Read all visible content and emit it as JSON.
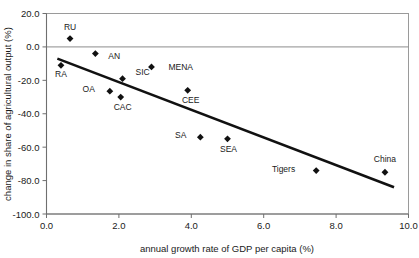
{
  "chart_data": {
    "type": "scatter",
    "title": "",
    "xlabel": "annual growth rate of GDP per capita (%)",
    "ylabel": "change in share of agricultural output (%)",
    "xlim": [
      0.0,
      10.0
    ],
    "ylim": [
      -100.0,
      20.0
    ],
    "xticks": [
      "0.0",
      "2.0",
      "4.0",
      "6.0",
      "8.0",
      "10.0"
    ],
    "xtick_values": [
      0.0,
      2.0,
      4.0,
      6.0,
      8.0,
      10.0
    ],
    "yticks": [
      "20.0",
      "0.0",
      "-20.0",
      "-40.0",
      "-60.0",
      "-80.0",
      "-100.0"
    ],
    "ytick_values": [
      20.0,
      0.0,
      -20.0,
      -40.0,
      -60.0,
      -80.0,
      -100.0
    ],
    "grid": false,
    "legend": "none",
    "zero_reference_line": 0.0,
    "points": [
      {
        "label": "RU",
        "x": 0.65,
        "y": 5.0,
        "label_dx": 0,
        "label_dy": -9
      },
      {
        "label": "RA",
        "x": 0.4,
        "y": -11.0,
        "label_dx": 0,
        "label_dy": 12
      },
      {
        "label": "AN",
        "x": 1.35,
        "y": -4.0,
        "label_dx": 13,
        "label_dy": 5
      },
      {
        "label": "OA",
        "x": 1.75,
        "y": -26.5,
        "label_dx": -15,
        "label_dy": 1
      },
      {
        "label": "CAC",
        "x": 2.05,
        "y": -30.0,
        "label_dx": 2,
        "label_dy": 13
      },
      {
        "label": "SIC",
        "x": 2.1,
        "y": -19.0,
        "label_dx": 13,
        "label_dy": -4
      },
      {
        "label": "MENA",
        "x": 2.9,
        "y": -12.0,
        "label_dx": 17,
        "label_dy": 3
      },
      {
        "label": "CEE",
        "x": 3.9,
        "y": -26.0,
        "label_dx": 3,
        "label_dy": 13
      },
      {
        "label": "SA",
        "x": 4.25,
        "y": -54.0,
        "label_dx": -14,
        "label_dy": 1
      },
      {
        "label": "SEA",
        "x": 5.0,
        "y": -55.0,
        "label_dx": 1,
        "label_dy": 13
      },
      {
        "label": "Tigers",
        "x": 7.45,
        "y": -74.0,
        "label_dx": -21,
        "label_dy": 1
      },
      {
        "label": "China",
        "x": 9.35,
        "y": -75.0,
        "label_dx": 0,
        "label_dy": -10
      }
    ],
    "trendline": {
      "x0": 0.3,
      "y0": -7.0,
      "x1": 9.6,
      "y1": -84.0
    }
  },
  "colors": {
    "marker": "#111111",
    "trendline": "#111111",
    "frame": "#9a9a9a",
    "axis": "#6f6f6f",
    "text": "#1a1a1a",
    "background": "#ffffff"
  }
}
